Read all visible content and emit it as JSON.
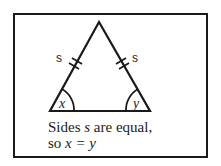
{
  "diagram": {
    "type": "isosceles-triangle",
    "side_labels": [
      "s",
      "s"
    ],
    "angle_labels": [
      "x",
      "y"
    ],
    "caption_line1": {
      "a": "Sides ",
      "var": "s",
      "b": " are equal,"
    },
    "caption_line2": {
      "a": "so ",
      "expr": "x = y"
    },
    "colors": {
      "stroke": "#1a1a1a",
      "background": "#ffffff"
    }
  }
}
